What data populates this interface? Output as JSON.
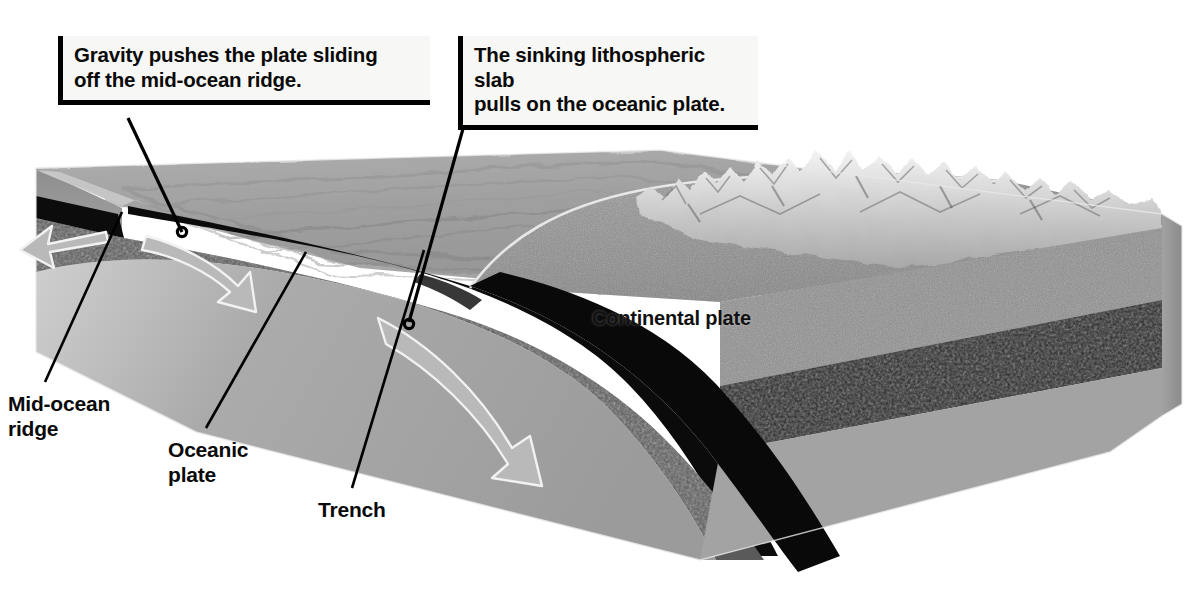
{
  "figure": {
    "background": "#ffffff"
  },
  "callouts": [
    {
      "id": "ridge-push",
      "text": "Gravity pushes the plate sliding\noff the mid-ocean ridge.",
      "leader_from": [
        128,
        118
      ],
      "leader_to": [
        182,
        232
      ]
    },
    {
      "id": "slab-pull",
      "text": "The sinking lithospheric slab\npulls on the oceanic plate.",
      "leader_from": [
        466,
        118
      ],
      "leader_to": [
        409,
        324
      ]
    }
  ],
  "leader_labels": [
    {
      "id": "mid-ocean-ridge",
      "text": "Mid-ocean\nridge",
      "leader_from": [
        45,
        382
      ],
      "leader_to": [
        122,
        212
      ]
    },
    {
      "id": "oceanic-plate",
      "text": "Oceanic\nplate",
      "leader_from": [
        206,
        428
      ],
      "leader_to": [
        305,
        253
      ]
    },
    {
      "id": "trench",
      "text": "Trench",
      "leader_from": [
        352,
        488
      ],
      "leader_to": [
        424,
        252
      ]
    }
  ],
  "map_labels": [
    {
      "id": "continental-plate",
      "text": "Continental plate"
    }
  ],
  "layers": {
    "ocean_floor": "abyssal-plain-texture",
    "oceanic_crust": "#111111",
    "oceanic_lithosphere": "#4a4a4a",
    "asthenosphere": "#9a9a9a",
    "continental_crust": "#8f8f8f",
    "continental_lithosphere": "#2a2a2a",
    "deep_mantle": "#a6a6a6",
    "mountains": "mountain-range-texture"
  },
  "arrows": [
    {
      "id": "ridge-spread-left",
      "direction": "left",
      "style": "white-outline"
    },
    {
      "id": "ridge-spread-right",
      "direction": "right-down",
      "style": "white-outline"
    },
    {
      "id": "slab-sink",
      "direction": "down-right-curved",
      "style": "white-outline"
    }
  ],
  "colors": {
    "outline": "#000000",
    "callout_fill": "#f7f7f5",
    "arrow_stroke": "#ffffff",
    "page": "#ffffff"
  }
}
